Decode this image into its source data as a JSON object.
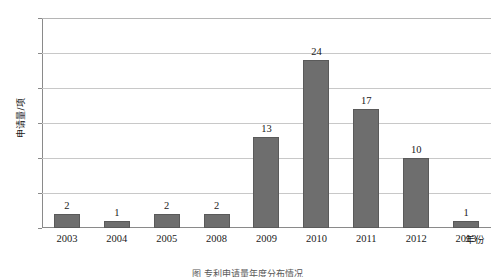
{
  "chart_data": {
    "type": "bar",
    "title": "",
    "categories": [
      "2003",
      "2004",
      "2005",
      "2008",
      "2009",
      "2010",
      "2011",
      "2012",
      "2013"
    ],
    "values": [
      2,
      1,
      2,
      2,
      13,
      24,
      17,
      10,
      1
    ],
    "data_labels": [
      "2",
      "1",
      "2",
      "2",
      "13",
      "24",
      "17",
      "10",
      "1"
    ],
    "xlabel": "年份",
    "ylabel": "申请量/项",
    "ylim": [
      0,
      30
    ],
    "ytick_values": [
      30,
      25,
      20,
      15,
      10,
      5,
      0
    ],
    "ytick_labels": [
      "30",
      "25",
      "10",
      "15",
      "10",
      "5",
      "0"
    ],
    "grid": true,
    "legend": false,
    "bar_color": "#6e6e6e",
    "gridline_color": "#c8c8c8",
    "axis_color": "#8a8a8a"
  },
  "caption": {
    "text": "图 专利申请量年度分布情况"
  }
}
